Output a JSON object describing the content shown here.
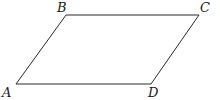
{
  "diagram": {
    "type": "parallelogram",
    "vertices": [
      {
        "id": "A",
        "label": "A",
        "x": 16,
        "y": 84,
        "label_x": 2,
        "label_y": 97
      },
      {
        "id": "B",
        "label": "B",
        "x": 66,
        "y": 15,
        "label_x": 57,
        "label_y": 12
      },
      {
        "id": "C",
        "label": "C",
        "x": 199,
        "y": 15,
        "label_x": 200,
        "label_y": 12
      },
      {
        "id": "D",
        "label": "D",
        "x": 151,
        "y": 84,
        "label_x": 148,
        "label_y": 97
      }
    ],
    "edges": [
      {
        "from": "A",
        "to": "B"
      },
      {
        "from": "B",
        "to": "C"
      },
      {
        "from": "C",
        "to": "D"
      },
      {
        "from": "D",
        "to": "A"
      }
    ],
    "stroke_color": "#2a2a2a",
    "label_color": "#1a1a1a"
  }
}
